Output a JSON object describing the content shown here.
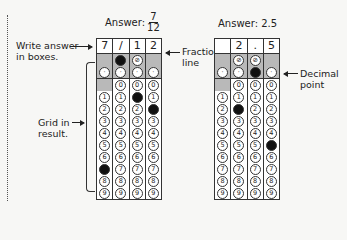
{
  "left_labels": {
    "write_answer": "Write answer in boxes.",
    "grid_in": "Grid in result."
  },
  "grid1": {
    "answer_label": "Answer:",
    "answer_num": "7",
    "answer_den": "12",
    "header": [
      "7",
      "/",
      "1",
      "2"
    ],
    "callout": "Fraction line",
    "filled": {
      "slash": [
        1
      ],
      "dot": [],
      "digits": {
        "0": 7,
        "2": 1,
        "3": 2
      }
    },
    "slash_cols": [
      1,
      2
    ],
    "zero_cols": [
      1,
      2,
      3
    ]
  },
  "grid2": {
    "answer_label": "Answer: 2.5",
    "header": [
      "",
      "2",
      ".",
      "5"
    ],
    "callout": "Decimal point",
    "filled": {
      "slash": [],
      "dot": [
        2
      ],
      "digits": {
        "1": 2,
        "3": 5
      }
    },
    "slash_cols": [
      1,
      2
    ],
    "zero_cols": [
      1,
      2,
      3
    ]
  },
  "symbols": {
    "slash": "⊘",
    "dot": "·"
  },
  "digits": [
    "0",
    "1",
    "2",
    "3",
    "4",
    "5",
    "6",
    "7",
    "8",
    "9"
  ],
  "colors": {
    "shade": "#b9b9b9",
    "fill": "#111111"
  }
}
